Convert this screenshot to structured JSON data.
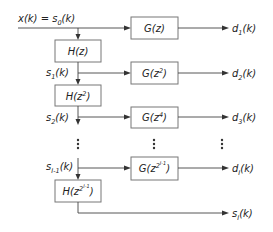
{
  "diagram": {
    "input": {
      "label": "x(k) = s",
      "sub": "0",
      "tail": "(k)"
    },
    "h_blocks": [
      {
        "base": "H(z",
        "sup": "",
        "close": ")"
      },
      {
        "base": "H(z",
        "sup": "2",
        "close": ")"
      },
      {
        "base": "H(z",
        "sup": "2",
        "supsup": "I-1",
        "close": ")"
      }
    ],
    "g_blocks": [
      {
        "base": "G(z",
        "sup": "",
        "close": ")"
      },
      {
        "base": "G(z",
        "sup": "2",
        "close": ")"
      },
      {
        "base": "G(z",
        "sup": "4",
        "close": ")"
      },
      {
        "base": "G(z",
        "sup": "2",
        "supsup": "I-1",
        "close": ")"
      }
    ],
    "s_labels": [
      {
        "s": "s",
        "sub": "1",
        "k": "(k)"
      },
      {
        "s": "s",
        "sub": "2",
        "k": "(k)"
      },
      {
        "s": "s",
        "sub": "I-1",
        "k": "(k)"
      },
      {
        "s": "s",
        "sub": "I",
        "k": "(k)"
      }
    ],
    "d_outputs": [
      {
        "d": "d",
        "sub": "1",
        "k": "(k)"
      },
      {
        "d": "d",
        "sub": "2",
        "k": "(k)"
      },
      {
        "d": "d",
        "sub": "3",
        "k": "(k)"
      },
      {
        "d": "d",
        "sub": "I",
        "k": "(k)"
      }
    ]
  }
}
